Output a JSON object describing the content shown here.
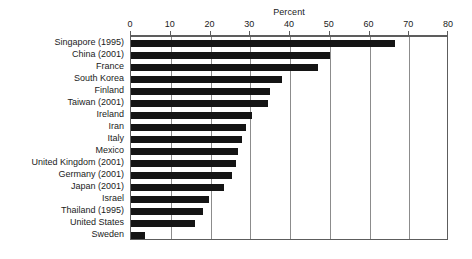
{
  "chart_data": {
    "type": "bar",
    "orientation": "horizontal",
    "title": "Percent",
    "xlabel": "Percent",
    "ylabel": "",
    "xlim": [
      0,
      80
    ],
    "xticks": [
      0,
      10,
      20,
      30,
      40,
      50,
      60,
      70,
      80
    ],
    "xtick_labels": [
      "0",
      "10",
      "20",
      "30",
      "40",
      "50",
      "60",
      "70",
      "80"
    ],
    "grid": true,
    "legend": null,
    "bar_color": "#141414",
    "categories": [
      "Singapore (1995)",
      "China (2001)",
      "France",
      "South Korea",
      "Finland",
      "Taiwan (2001)",
      "Ireland",
      "Iran",
      "Italy",
      "Mexico",
      "United Kingdom (2001)",
      "Germany (2001)",
      "Japan (2001)",
      "Israel",
      "Thailand (1995)",
      "United States",
      "Sweden"
    ],
    "values": [
      66.5,
      50,
      47,
      38,
      35,
      34.5,
      30.5,
      29,
      28,
      27,
      26.5,
      25.5,
      23.5,
      19.5,
      18,
      16,
      3.5
    ]
  }
}
